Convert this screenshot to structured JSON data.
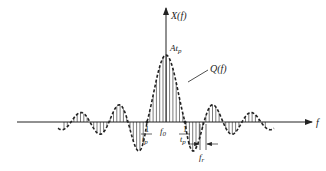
{
  "diagram": {
    "type": "spectrum-sketch",
    "y_axis_label": "X(f)",
    "x_axis_label": "f",
    "peak_label": "At",
    "peak_label_sub": "p",
    "curve_label": "Q(f)",
    "center_label": "f",
    "center_label_sub": "0",
    "left_zero_label_num": "1",
    "left_zero_label_den": "t",
    "left_zero_label_den_sub": "p",
    "right_zero_label_num": "1",
    "right_zero_label_den": "t",
    "right_zero_label_den_sub": "p",
    "spacing_label": "f",
    "spacing_label_sub": "r",
    "colors": {
      "ink": "#222222",
      "background": "#ffffff"
    }
  }
}
